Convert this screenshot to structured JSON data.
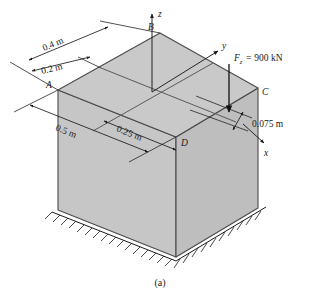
{
  "figure": {
    "caption": "(a)",
    "corners": [
      {
        "id": "A",
        "label": "A"
      },
      {
        "id": "B",
        "label": "B"
      },
      {
        "id": "C",
        "label": "C"
      },
      {
        "id": "D",
        "label": "D"
      }
    ],
    "axes": [
      {
        "id": "x",
        "label": "x"
      },
      {
        "id": "y",
        "label": "y"
      },
      {
        "id": "z",
        "label": "z"
      }
    ],
    "force": {
      "symbol": "F",
      "subscript": "z",
      "equals": "=",
      "value": "900 kN",
      "full_label": "F_z = 900 kN"
    },
    "dimensions": [
      {
        "id": "d-0p4",
        "label": "0.4 m"
      },
      {
        "id": "d-0p2",
        "label": "0.2 m"
      },
      {
        "id": "d-0p5",
        "label": "0.5 m"
      },
      {
        "id": "d-0p25",
        "label": "0.25 m"
      },
      {
        "id": "d-0p075",
        "label": "0.075 m"
      }
    ],
    "colors": {
      "top_face": "#c9c9c9",
      "left_face": "#c6c6c6",
      "right_face": "#bebebe",
      "edge": "#4a4a4a",
      "ink": "#1a1a1a",
      "background": "#ffffff"
    }
  }
}
